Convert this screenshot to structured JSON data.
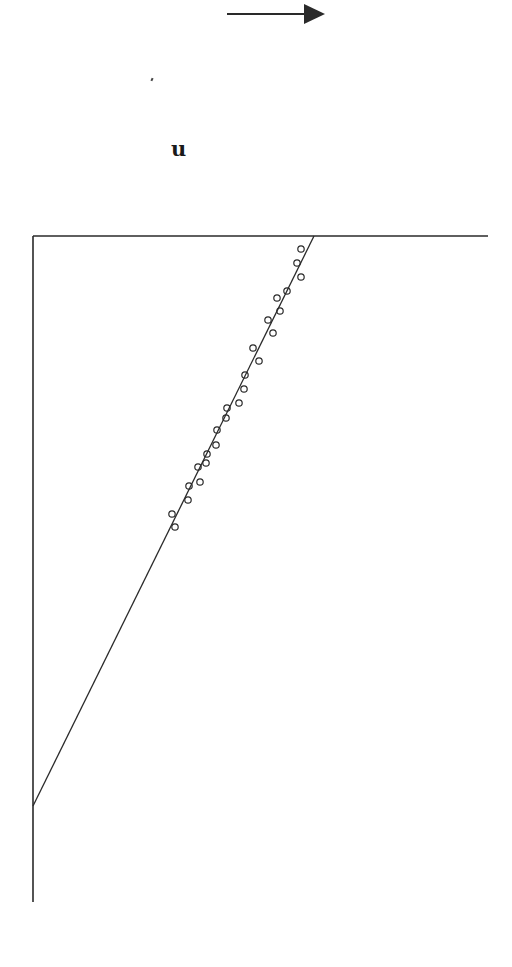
{
  "diagram": {
    "label": "u",
    "arrow": {
      "direction": "right",
      "x1": 227,
      "y1": 14,
      "x2": 325,
      "y2": 14,
      "color": "#2a2a2a"
    },
    "frame": {
      "left_axis": {
        "x": 33,
        "y_top": 236,
        "y_bottom": 902
      },
      "top_axis": {
        "y": 236,
        "x_left": 33,
        "x_right": 488
      },
      "color": "#2a2a2a"
    },
    "fit_line": {
      "x1": 314,
      "y1": 236,
      "x2": 33,
      "y2": 806,
      "color": "#2a2a2a"
    },
    "points_style": {
      "shape": "open-circle",
      "radius": 3.2,
      "color": "#2a2a2a"
    },
    "points": [
      [
        301,
        249
      ],
      [
        297,
        263
      ],
      [
        301,
        277
      ],
      [
        287,
        291
      ],
      [
        277,
        298
      ],
      [
        280,
        311
      ],
      [
        268,
        320
      ],
      [
        273,
        333
      ],
      [
        253,
        348
      ],
      [
        259,
        361
      ],
      [
        245,
        375
      ],
      [
        244,
        389
      ],
      [
        239,
        403
      ],
      [
        227,
        408
      ],
      [
        226,
        418
      ],
      [
        217,
        430
      ],
      [
        216,
        445
      ],
      [
        207,
        454
      ],
      [
        206,
        463
      ],
      [
        198,
        467
      ],
      [
        200,
        482
      ],
      [
        189,
        486
      ],
      [
        188,
        500
      ],
      [
        172,
        514
      ],
      [
        175,
        527
      ]
    ]
  }
}
